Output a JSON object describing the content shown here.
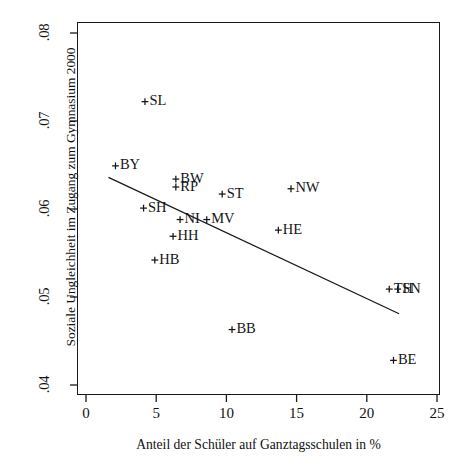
{
  "chart_data": {
    "type": "scatter",
    "title": "",
    "xlabel": "Anteil der Schüler auf Ganztagsschulen in %",
    "ylabel": "Soziale Ungleichheit im Zugang zum Gymnasium 2000",
    "xlim": [
      0,
      25
    ],
    "ylim": [
      0.04,
      0.08
    ],
    "xticks": [
      0,
      5,
      10,
      15,
      20,
      25
    ],
    "xticklabels": [
      "0",
      "5",
      "10",
      "15",
      "20",
      "25"
    ],
    "yticks": [
      0.04,
      0.05,
      0.06,
      0.07,
      0.08
    ],
    "yticklabels": [
      ".04",
      ".05",
      ".06",
      ".07",
      ".08"
    ],
    "grid": false,
    "legend": null,
    "marker": "plus",
    "points": [
      {
        "label": "SL",
        "x": 4.2,
        "y": 0.0722
      },
      {
        "label": "BY",
        "x": 2.1,
        "y": 0.0649
      },
      {
        "label": "BW",
        "x": 6.4,
        "y": 0.0634
      },
      {
        "label": "RP",
        "x": 6.4,
        "y": 0.0625
      },
      {
        "label": "ST",
        "x": 9.7,
        "y": 0.0617
      },
      {
        "label": "NW",
        "x": 14.6,
        "y": 0.0623
      },
      {
        "label": "SH",
        "x": 4.1,
        "y": 0.0601
      },
      {
        "label": "NI",
        "x": 6.7,
        "y": 0.0588
      },
      {
        "label": "MV",
        "x": 8.6,
        "y": 0.0588
      },
      {
        "label": "HE",
        "x": 13.7,
        "y": 0.0576
      },
      {
        "label": "HH",
        "x": 6.2,
        "y": 0.0569
      },
      {
        "label": "HB",
        "x": 4.9,
        "y": 0.0542
      },
      {
        "label": "TH",
        "x": 21.6,
        "y": 0.0509
      },
      {
        "label": "SN",
        "x": 22.2,
        "y": 0.0509
      },
      {
        "label": "BB",
        "x": 10.4,
        "y": 0.0463
      },
      {
        "label": "BE",
        "x": 21.9,
        "y": 0.0428
      }
    ],
    "trendline": {
      "name": "regression-line",
      "x0": 1.6,
      "y0": 0.0636,
      "x1": 22.3,
      "y1": 0.0481
    }
  }
}
